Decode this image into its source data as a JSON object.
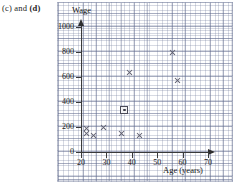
{
  "caption": {
    "prefix": "(c) and ",
    "bold": "(d)"
  },
  "chart_data": {
    "type": "scatter",
    "title": "",
    "xlabel": "Age (years)",
    "ylabel": "Wage",
    "xlim": [
      20,
      72
    ],
    "ylim": [
      0,
      1050
    ],
    "xticks": [
      20,
      30,
      40,
      50,
      60,
      70
    ],
    "yticks": [
      0,
      200,
      400,
      600,
      800,
      1000
    ],
    "grid": true,
    "legend": "none",
    "series": [
      {
        "name": "Data points",
        "marker": "cross",
        "points": [
          {
            "x": 22,
            "y": 190
          },
          {
            "x": 22,
            "y": 150
          },
          {
            "x": 25,
            "y": 130
          },
          {
            "x": 29,
            "y": 200
          },
          {
            "x": 36,
            "y": 150
          },
          {
            "x": 39,
            "y": 640
          },
          {
            "x": 43,
            "y": 135
          },
          {
            "x": 56,
            "y": 800
          },
          {
            "x": 58,
            "y": 570
          }
        ]
      },
      {
        "name": "Mean point",
        "marker": "boxed-dot",
        "points": [
          {
            "x": 37,
            "y": 340
          }
        ]
      }
    ]
  }
}
